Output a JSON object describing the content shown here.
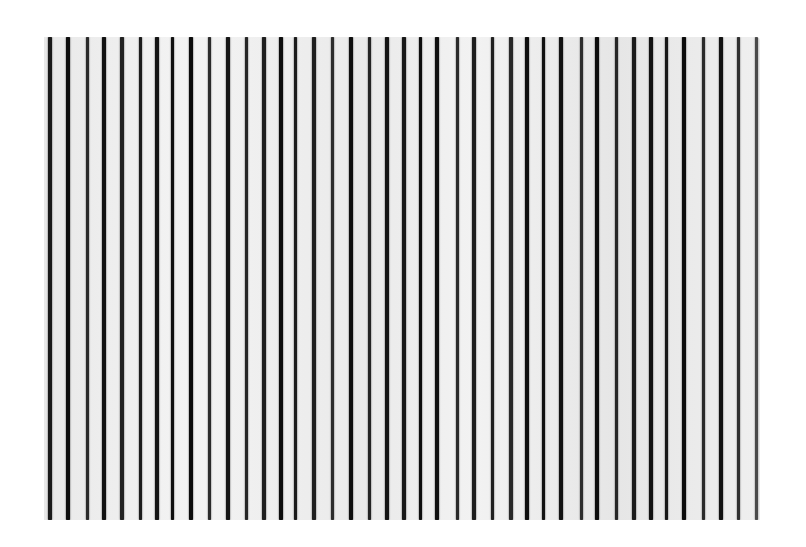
{
  "image": {
    "description": "Photograph of a vertical line grating pattern: dark vertical stripes on a light gray-white field",
    "background_color": "#ffffff",
    "field": {
      "x": 44,
      "y": 37,
      "width": 716,
      "height": 483,
      "color": "#ededed"
    },
    "stripe_color": "#111111",
    "stripes": [
      {
        "x": 50,
        "w": 4,
        "shade": "#1a1a1a"
      },
      {
        "x": 68,
        "w": 4,
        "shade": "#0e0e0e"
      },
      {
        "x": 87,
        "w": 3,
        "shade": "#2a2a2a"
      },
      {
        "x": 104,
        "w": 4,
        "shade": "#111111"
      },
      {
        "x": 122,
        "w": 4,
        "shade": "#222222"
      },
      {
        "x": 140,
        "w": 3,
        "shade": "#1c1c1c"
      },
      {
        "x": 157,
        "w": 4,
        "shade": "#141414"
      },
      {
        "x": 172,
        "w": 3,
        "shade": "#101010"
      },
      {
        "x": 191,
        "w": 4,
        "shade": "#0c0c0c"
      },
      {
        "x": 209,
        "w": 3,
        "shade": "#2b2b2b"
      },
      {
        "x": 228,
        "w": 4,
        "shade": "#151515"
      },
      {
        "x": 246,
        "w": 3,
        "shade": "#262626"
      },
      {
        "x": 264,
        "w": 4,
        "shade": "#1e1e1e"
      },
      {
        "x": 281,
        "w": 4,
        "shade": "#0d0d0d"
      },
      {
        "x": 295,
        "w": 3,
        "shade": "#1b1b1b"
      },
      {
        "x": 314,
        "w": 4,
        "shade": "#1f1f1f"
      },
      {
        "x": 332,
        "w": 3,
        "shade": "#2c2c2c"
      },
      {
        "x": 351,
        "w": 4,
        "shade": "#0f0f0f"
      },
      {
        "x": 369,
        "w": 3,
        "shade": "#242424"
      },
      {
        "x": 387,
        "w": 4,
        "shade": "#141414"
      },
      {
        "x": 404,
        "w": 4,
        "shade": "#181818"
      },
      {
        "x": 420,
        "w": 3,
        "shade": "#0e0e0e"
      },
      {
        "x": 437,
        "w": 4,
        "shade": "#101010"
      },
      {
        "x": 457,
        "w": 3,
        "shade": "#2a2a2a"
      },
      {
        "x": 474,
        "w": 4,
        "shade": "#1d1d1d"
      },
      {
        "x": 492,
        "w": 3,
        "shade": "#202020"
      },
      {
        "x": 511,
        "w": 4,
        "shade": "#282828"
      },
      {
        "x": 527,
        "w": 4,
        "shade": "#0e0e0e"
      },
      {
        "x": 543,
        "w": 3,
        "shade": "#111111"
      },
      {
        "x": 561,
        "w": 4,
        "shade": "#131313"
      },
      {
        "x": 581,
        "w": 3,
        "shade": "#2d2d2d"
      },
      {
        "x": 597,
        "w": 4,
        "shade": "#0c0c0c"
      },
      {
        "x": 616,
        "w": 3,
        "shade": "#262626"
      },
      {
        "x": 634,
        "w": 4,
        "shade": "#1a1a1a"
      },
      {
        "x": 651,
        "w": 4,
        "shade": "#121212"
      },
      {
        "x": 666,
        "w": 3,
        "shade": "#171717"
      },
      {
        "x": 684,
        "w": 4,
        "shade": "#0b0b0b"
      },
      {
        "x": 703,
        "w": 3,
        "shade": "#2a2a2a"
      },
      {
        "x": 721,
        "w": 4,
        "shade": "#121212"
      },
      {
        "x": 738,
        "w": 3,
        "shade": "#303030"
      },
      {
        "x": 756,
        "w": 3,
        "shade": "#4a4a4a"
      }
    ]
  }
}
